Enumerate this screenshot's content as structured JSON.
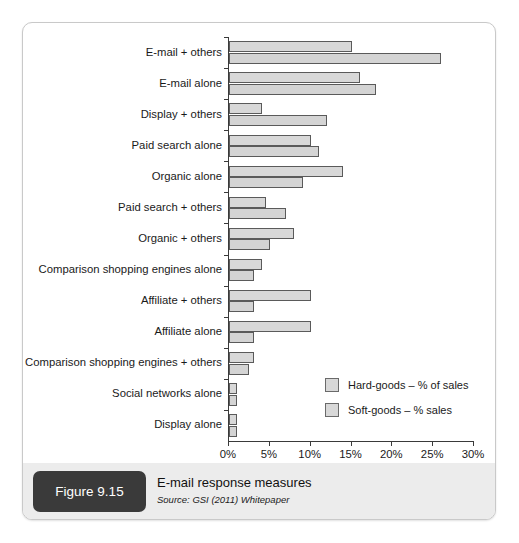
{
  "figure": {
    "number_label": "Figure 9.15",
    "title": "E-mail response measures",
    "source": "Source: GSI (2011) Whitepaper"
  },
  "legend": {
    "position": "inside-bottom-right",
    "items": [
      {
        "label": "Hard-goods – % of sales",
        "color": "#d8d8d8"
      },
      {
        "label": "Soft-goods – % sales",
        "color": "#d4d4d4"
      }
    ]
  },
  "chart_data": {
    "type": "bar",
    "orientation": "horizontal",
    "title": "E-mail response measures",
    "xlabel": "",
    "ylabel": "",
    "xlim": [
      0,
      30
    ],
    "grid": false,
    "tick_labels": [
      "0%",
      "5%",
      "10%",
      "15%",
      "20%",
      "25%",
      "30%"
    ],
    "tick_values": [
      0,
      5,
      10,
      15,
      20,
      25,
      30
    ],
    "categories": [
      "E-mail + others",
      "E-mail alone",
      "Display + others",
      "Paid search alone",
      "Organic alone",
      "Paid search + others",
      "Organic + others",
      "Comparison shopping engines alone",
      "Affiliate + others",
      "Affiliate alone",
      "Comparison shopping engines + others",
      "Social networks alone",
      "Display alone"
    ],
    "series": [
      {
        "name": "Hard-goods – % of sales",
        "values": [
          15,
          16,
          4,
          10,
          14,
          4.5,
          8,
          4,
          10,
          10,
          3,
          1,
          1
        ]
      },
      {
        "name": "Soft-goods – % sales",
        "values": [
          26,
          18,
          12,
          11,
          9,
          7,
          5,
          3,
          3,
          3,
          2.5,
          1,
          1
        ]
      }
    ]
  }
}
